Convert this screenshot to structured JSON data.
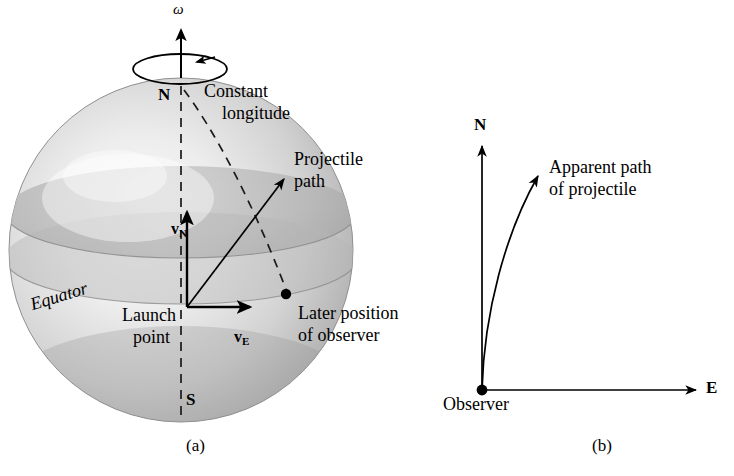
{
  "figure": {
    "domain": "physics-diagram",
    "background": "#ffffff",
    "ink": "#000000",
    "panels": [
      {
        "id": "a",
        "caption": "(a)",
        "caption_x": 186,
        "caption_y": 447
      },
      {
        "id": "b",
        "caption": "(b)",
        "caption_x": 592,
        "caption_y": 447
      }
    ]
  },
  "panel_a": {
    "sphere": {
      "cx": 181,
      "cy": 250,
      "r": 172,
      "fill_light": "#f2f2f2",
      "fill_mid": "#c9c9c9",
      "fill_dark": "#9a9a9a",
      "outline": "#8d8d8d"
    },
    "labels": {
      "omega": "ω",
      "north_pole": "N",
      "south_pole": "S",
      "constant_longitude_line1": "Constant",
      "constant_longitude_line2": "longitude",
      "projectile_line1": "Projectile",
      "projectile_line2": "path",
      "equator": "Equator",
      "launch_line1": "Launch",
      "launch_line2": "point",
      "later_line1": "Later position",
      "later_line2": "of observer",
      "v_north_base": "v",
      "v_north_sub": "N",
      "v_east_base": "v",
      "v_east_sub": "E"
    },
    "geometry": {
      "origin_x": 187,
      "origin_y": 307,
      "vN_tip_y": 214,
      "vE_tip_x": 253,
      "projectile_tip_x": 286,
      "projectile_tip_y": 177,
      "observer_dot_x": 286,
      "observer_dot_y": 294,
      "axis_top_y": 28,
      "axis_bottom_y": 420,
      "spin_ellipse_cx": 180,
      "spin_ellipse_cy": 68,
      "spin_ellipse_rx": 47,
      "spin_ellipse_ry": 14
    }
  },
  "panel_b": {
    "labels": {
      "north_axis": "N",
      "east_axis": "E",
      "observer": "Observer",
      "apparent_line1": "Apparent path",
      "apparent_line2": "of projectile"
    },
    "geometry": {
      "origin_x": 482,
      "origin_y": 390,
      "n_axis_tip_y": 141,
      "e_axis_tip_x": 700,
      "curve_tip_x": 541,
      "curve_tip_y": 171,
      "curve_ctrl_x": 487,
      "curve_ctrl_y": 250
    }
  }
}
